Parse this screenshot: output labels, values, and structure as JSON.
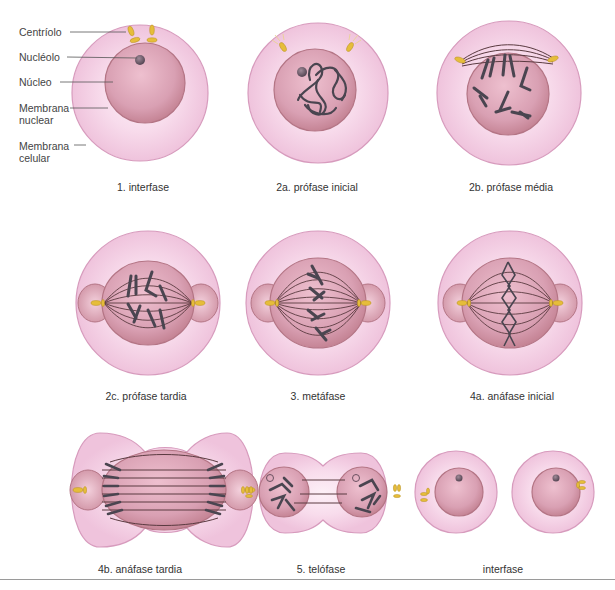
{
  "figure": {
    "labels": {
      "centriolo": "Centríolo",
      "nucleolo": "Nucléolo",
      "nucleo": "Núcleo",
      "membrana_nuclear_1": "Membrana",
      "membrana_nuclear_2": "nuclear",
      "membrana_celular_1": "Membrana",
      "membrana_celular_2": "celular"
    },
    "stages": [
      {
        "id": "1",
        "caption": "1. interfase"
      },
      {
        "id": "2a",
        "caption": "2a. prófase inicial"
      },
      {
        "id": "2b",
        "caption": "2b. prófase média"
      },
      {
        "id": "2c",
        "caption": "2c. prófase tardia"
      },
      {
        "id": "3",
        "caption": "3. metáfase"
      },
      {
        "id": "4a",
        "caption": "4a. anáfase inicial"
      },
      {
        "id": "4b",
        "caption": "4b. anáfase tardia"
      },
      {
        "id": "5",
        "caption": "5. telófase"
      },
      {
        "id": "6",
        "caption": "interfase"
      }
    ],
    "colors": {
      "cytoplasm": "#f3cfe3",
      "cell_edge": "#d99bbd",
      "nucleus": "#d79aae",
      "nucleus_edge": "#b0707f",
      "chromosome": "#4a4550",
      "centriole": "#e8c040",
      "spindle": "#5a3a40"
    }
  }
}
